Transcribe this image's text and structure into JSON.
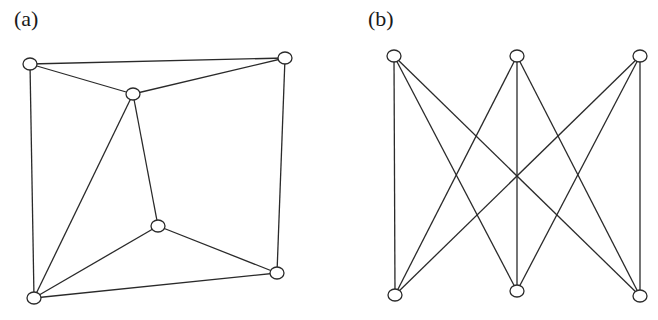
{
  "panels": [
    {
      "label": "(a)",
      "label_pos": [
        14,
        6
      ],
      "node_radius": [
        7,
        6
      ],
      "nodes": [
        {
          "id": "a1",
          "x": 30,
          "y": 64
        },
        {
          "id": "a2",
          "x": 133,
          "y": 94
        },
        {
          "id": "a3",
          "x": 285,
          "y": 58
        },
        {
          "id": "a4",
          "x": 158,
          "y": 226
        },
        {
          "id": "a5",
          "x": 277,
          "y": 273
        },
        {
          "id": "a6",
          "x": 34,
          "y": 298
        }
      ],
      "edges": [
        [
          "a1",
          "a3"
        ],
        [
          "a1",
          "a2"
        ],
        [
          "a2",
          "a3"
        ],
        [
          "a1",
          "a6"
        ],
        [
          "a3",
          "a5"
        ],
        [
          "a2",
          "a6"
        ],
        [
          "a2",
          "a4"
        ],
        [
          "a4",
          "a6"
        ],
        [
          "a4",
          "a5"
        ],
        [
          "a6",
          "a5"
        ]
      ]
    },
    {
      "label": "(b)",
      "label_pos": [
        368,
        6
      ],
      "node_radius": [
        7,
        6
      ],
      "nodes": [
        {
          "id": "b1",
          "x": 394,
          "y": 56
        },
        {
          "id": "b2",
          "x": 517,
          "y": 56
        },
        {
          "id": "b3",
          "x": 640,
          "y": 56
        },
        {
          "id": "b4",
          "x": 395,
          "y": 295
        },
        {
          "id": "b5",
          "x": 517,
          "y": 291
        },
        {
          "id": "b6",
          "x": 640,
          "y": 296
        }
      ],
      "edges": [
        [
          "b1",
          "b4"
        ],
        [
          "b1",
          "b5"
        ],
        [
          "b1",
          "b6"
        ],
        [
          "b2",
          "b4"
        ],
        [
          "b2",
          "b5"
        ],
        [
          "b2",
          "b6"
        ],
        [
          "b3",
          "b4"
        ],
        [
          "b3",
          "b5"
        ],
        [
          "b3",
          "b6"
        ]
      ]
    }
  ]
}
